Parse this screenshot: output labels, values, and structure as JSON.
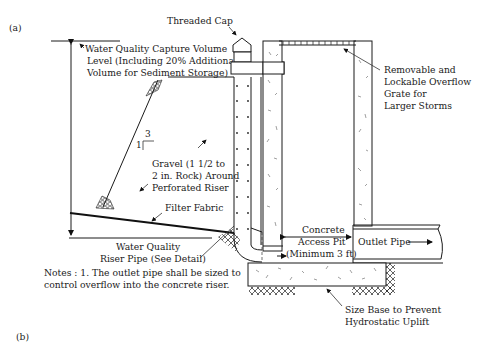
{
  "figure": {
    "panel_a_label": "(a)",
    "panel_b_label": "(b)"
  },
  "labels": {
    "threaded_cap": "Threaded Cap",
    "wqcv_line1": "Water Quality Capture Volume",
    "wqcv_line2": "Level (Including 20% Additional",
    "wqcv_line3": "Volume for Sediment Storage)",
    "grate_line1": "Removable and",
    "grate_line2": "Lockable Overflow",
    "grate_line3": "Grate for",
    "grate_line4": "Larger Storms",
    "slope_rise": "1",
    "slope_run": "3",
    "gravel_line1": "Gravel (1 1/2 to",
    "gravel_line2": "2 in. Rock) Around",
    "gravel_line3": "Perforated Riser",
    "filter_fabric": "Filter Fabric",
    "riser_line1": "Water Quality",
    "riser_line2": "Riser Pipe (See Detail)",
    "pit_line1": "Concrete",
    "pit_line2": "Access Pit",
    "pit_line3": "(Minimum 3 ft)",
    "outlet_pipe": "Outlet Pipe",
    "base_line1": "Size Base to Prevent",
    "base_line2": "Hydrostatic Uplift"
  },
  "notes": {
    "line1": "Notes : 1. The outlet pipe shall be sized to",
    "line2": "control overflow into the concrete riser."
  },
  "colors": {
    "line": "#1a1a1a",
    "background": "#ffffff"
  }
}
